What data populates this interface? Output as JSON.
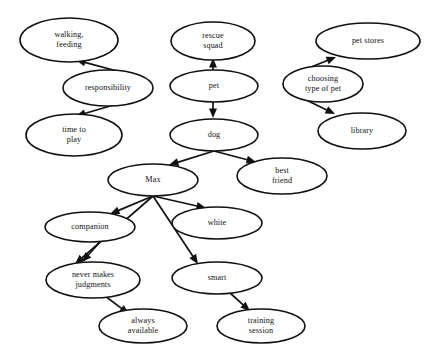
{
  "diagram": {
    "background_color": "#ffffff",
    "node_fill": "#ffffff",
    "node_stroke": "#111111",
    "edge_color": "#111111",
    "nodes": [
      {
        "id": "walking_feeding",
        "lines": [
          "walking,",
          "feeding"
        ],
        "cx": 69,
        "cy": 40,
        "rx": 49,
        "ry": 22
      },
      {
        "id": "responsibility",
        "lines": [
          "responsibility"
        ],
        "cx": 108,
        "cy": 88,
        "rx": 45,
        "ry": 18
      },
      {
        "id": "time_to_play",
        "lines": [
          "time to",
          "play"
        ],
        "cx": 74,
        "cy": 135,
        "rx": 48,
        "ry": 21
      },
      {
        "id": "rescue_squad",
        "lines": [
          "rescue",
          "squad"
        ],
        "cx": 213,
        "cy": 41,
        "rx": 42,
        "ry": 19
      },
      {
        "id": "pet",
        "lines": [
          "pet"
        ],
        "cx": 214,
        "cy": 86,
        "rx": 44,
        "ry": 16
      },
      {
        "id": "dog",
        "lines": [
          "dog"
        ],
        "cx": 214,
        "cy": 135,
        "rx": 44,
        "ry": 16
      },
      {
        "id": "pet_stores",
        "lines": [
          "pet stores"
        ],
        "cx": 368,
        "cy": 41,
        "rx": 52,
        "ry": 18
      },
      {
        "id": "choosing_type_of_pet",
        "lines": [
          "choosing",
          "type of pet"
        ],
        "cx": 323,
        "cy": 84,
        "rx": 40,
        "ry": 18
      },
      {
        "id": "library",
        "lines": [
          "library"
        ],
        "cx": 362,
        "cy": 131,
        "rx": 44,
        "ry": 18
      },
      {
        "id": "max",
        "lines": [
          "Max"
        ],
        "cx": 153,
        "cy": 180,
        "rx": 45,
        "ry": 16
      },
      {
        "id": "best_friend",
        "lines": [
          "best",
          "friend"
        ],
        "cx": 282,
        "cy": 176,
        "rx": 45,
        "ry": 18
      },
      {
        "id": "companion",
        "lines": [
          "companion"
        ],
        "cx": 90,
        "cy": 227,
        "rx": 45,
        "ry": 15
      },
      {
        "id": "white",
        "lines": [
          "white"
        ],
        "cx": 217,
        "cy": 223,
        "rx": 45,
        "ry": 16
      },
      {
        "id": "never_makes_judgments",
        "lines": [
          "never makes",
          "judgments"
        ],
        "cx": 93,
        "cy": 280,
        "rx": 47,
        "ry": 18
      },
      {
        "id": "smart",
        "lines": [
          "smart"
        ],
        "cx": 217,
        "cy": 278,
        "rx": 45,
        "ry": 16
      },
      {
        "id": "always_available",
        "lines": [
          "always",
          "available"
        ],
        "cx": 143,
        "cy": 326,
        "rx": 44,
        "ry": 17
      },
      {
        "id": "training_session",
        "lines": [
          "training",
          "session"
        ],
        "cx": 261,
        "cy": 326,
        "rx": 44,
        "ry": 17
      }
    ],
    "edges": [
      {
        "id": "responsibility-walking_feeding",
        "from": "responsibility",
        "to": "walking_feeding",
        "x1": 117,
        "y1": 71,
        "x2": 76,
        "y2": 60
      },
      {
        "id": "responsibility-time_to_play",
        "from": "responsibility",
        "to": "time_to_play",
        "x1": 117,
        "y1": 104,
        "x2": 76,
        "y2": 116
      },
      {
        "id": "pet-rescue_squad",
        "from": "pet",
        "to": "rescue_squad",
        "x1": 213,
        "y1": 70,
        "x2": 213,
        "y2": 58
      },
      {
        "id": "pet-dog",
        "from": "pet",
        "to": "dog",
        "x1": 213,
        "y1": 102,
        "x2": 213,
        "y2": 118
      },
      {
        "id": "choosing_type_of_pet-pet_stores",
        "from": "choosing_type_of_pet",
        "to": "pet_stores",
        "x1": 294,
        "y1": 74,
        "x2": 336,
        "y2": 57
      },
      {
        "id": "choosing_type_of_pet-library",
        "from": "choosing_type_of_pet",
        "to": "library",
        "x1": 296,
        "y1": 95,
        "x2": 335,
        "y2": 114
      },
      {
        "id": "dog-max",
        "from": "dog",
        "to": "max",
        "x1": 214,
        "y1": 151,
        "x2": 169,
        "y2": 165
      },
      {
        "id": "dog-best_friend",
        "from": "dog",
        "to": "best_friend",
        "x1": 214,
        "y1": 151,
        "x2": 256,
        "y2": 162
      },
      {
        "id": "max-companion",
        "from": "max",
        "to": "companion",
        "x1": 153,
        "y1": 196,
        "x2": 110,
        "y2": 214
      },
      {
        "id": "max-never_makes_judgments",
        "from": "max",
        "to": "never_makes_judgments",
        "x1": 153,
        "y1": 196,
        "x2": 75,
        "y2": 264
      },
      {
        "id": "max-white",
        "from": "max",
        "to": "white",
        "x1": 153,
        "y1": 196,
        "x2": 206,
        "y2": 208
      },
      {
        "id": "max-smart",
        "from": "max",
        "to": "smart",
        "x1": 153,
        "y1": 196,
        "x2": 198,
        "y2": 264
      },
      {
        "id": "companion-never_makes_judgments",
        "from": "companion",
        "to": "never_makes_judgments",
        "x1": 100,
        "y1": 242,
        "x2": 82,
        "y2": 262
      },
      {
        "id": "never_makes_judgments-always_available",
        "from": "never_makes_judgments",
        "to": "always_available",
        "x1": 105,
        "y1": 296,
        "x2": 129,
        "y2": 314
      },
      {
        "id": "smart-training_session",
        "from": "smart",
        "to": "training_session",
        "x1": 229,
        "y1": 292,
        "x2": 250,
        "y2": 311
      }
    ]
  }
}
